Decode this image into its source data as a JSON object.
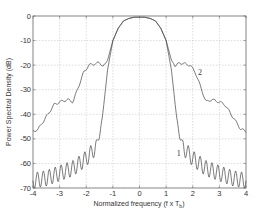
{
  "chart_data": {
    "type": "line",
    "title": "",
    "xlabel": "Normalized frequency (f x T",
    "xlabel_sub": "b",
    "xlabel_close": ")",
    "ylabel": "Power Spectral Density (dB)",
    "xlim": [
      -4,
      4
    ],
    "ylim": [
      -70,
      0
    ],
    "xticks": [
      -4,
      -3,
      -2,
      -1,
      0,
      1,
      2,
      3,
      4
    ],
    "yticks": [
      0,
      -10,
      -20,
      -30,
      -40,
      -50,
      -60,
      -70
    ],
    "grid": true,
    "legend": "none (curves labeled inline)",
    "series": [
      {
        "name": "1",
        "label_pos": [
          1.4,
          -57
        ],
        "description": "Main lobe with steep roll-off; oscillating sidelobes decaying from about -52 dB at |f|=1.5 to about -66 dB at |f|=4",
        "x": [
          -4.0,
          -3.5,
          -3.0,
          -2.5,
          -2.0,
          -1.6,
          -1.4,
          -1.2,
          -1.0,
          -0.8,
          -0.6,
          -0.4,
          -0.2,
          0.0,
          0.2,
          0.4,
          0.6,
          0.8,
          1.0,
          1.2,
          1.4,
          1.6,
          2.0,
          2.5,
          3.0,
          3.5,
          4.0
        ],
        "y": [
          -67,
          -66,
          -64,
          -62,
          -58,
          -53,
          -42,
          -22,
          -10,
          -5,
          -2,
          -1,
          -0.5,
          -0.5,
          -0.5,
          -1,
          -2,
          -5,
          -10,
          -22,
          -42,
          -53,
          -58,
          -62,
          -64,
          -66,
          -67
        ]
      },
      {
        "name": "2",
        "label_pos": [
          2.2,
          -24
        ],
        "description": "Main lobe with spectral regrowth shoulders around -19 dB near |f|=1.6, decaying to about -47 dB at |f|=4",
        "x": [
          -4.0,
          -3.8,
          -3.5,
          -3.2,
          -3.0,
          -2.7,
          -2.5,
          -2.3,
          -2.1,
          -1.9,
          -1.7,
          -1.5,
          -1.35,
          -1.2,
          -1.0,
          -0.8,
          -0.6,
          -0.4,
          -0.2,
          0.0,
          0.2,
          0.4,
          0.6,
          0.8,
          1.0,
          1.2,
          1.35,
          1.5,
          1.7,
          1.9,
          2.1,
          2.3,
          2.5,
          2.7,
          3.0,
          3.2,
          3.5,
          3.8,
          4.0
        ],
        "y": [
          -47,
          -46,
          -41,
          -36,
          -35,
          -34,
          -35,
          -29,
          -23,
          -20,
          -19.5,
          -19,
          -20.5,
          -18,
          -10,
          -5,
          -2,
          -1,
          -0.5,
          -0.5,
          -0.5,
          -1,
          -2,
          -5,
          -10,
          -18,
          -20.5,
          -19,
          -19.5,
          -20,
          -23,
          -29,
          -35,
          -34,
          -35,
          -36,
          -41,
          -46,
          -47
        ]
      }
    ]
  }
}
